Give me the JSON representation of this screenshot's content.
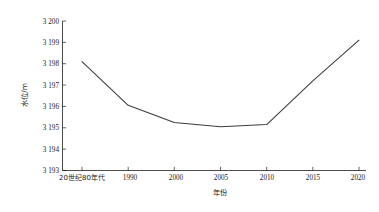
{
  "chart_data": {
    "type": "line",
    "title": "",
    "xlabel": "年份",
    "ylabel": "水位/m",
    "categories": [
      "20世纪80年代",
      "1990",
      "2000",
      "2005",
      "2010",
      "2015",
      "2020"
    ],
    "values": [
      3198.1,
      3196.05,
      3195.25,
      3195.05,
      3195.15,
      3197.2,
      3199.1
    ],
    "ylim": [
      3193,
      3200
    ],
    "ytick_labels": [
      "3 193",
      "3 194",
      "3 195",
      "3 196",
      "3 197",
      "3 198",
      "3 199",
      "3 200"
    ],
    "ytick_values": [
      3193,
      3194,
      3195,
      3196,
      3197,
      3198,
      3199,
      3200
    ],
    "grid": false,
    "legend": null,
    "series": [
      {
        "name": "水位",
        "color": "#3b3b3b",
        "values": [
          3198.1,
          3196.05,
          3195.25,
          3195.05,
          3195.15,
          3197.2,
          3199.1
        ]
      }
    ]
  },
  "axes": {
    "y_title": "水位/m",
    "x_title": "年份"
  },
  "ticks": {
    "y": [
      {
        "label": "3 200"
      },
      {
        "label": "3 199"
      },
      {
        "label": "3 198"
      },
      {
        "label": "3 197"
      },
      {
        "label": "3 196"
      },
      {
        "label": "3 195"
      },
      {
        "label": "3 194"
      },
      {
        "label": "3 193"
      }
    ],
    "x": [
      {
        "label": "20世纪80年代"
      },
      {
        "label": "1990"
      },
      {
        "label": "2000"
      },
      {
        "label": "2005"
      },
      {
        "label": "2010"
      },
      {
        "label": "2015"
      },
      {
        "label": "2020"
      }
    ]
  }
}
